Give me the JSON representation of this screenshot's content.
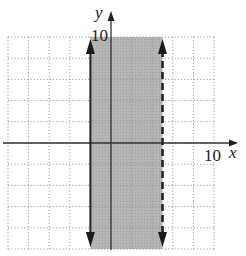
{
  "chart_data": {
    "type": "area",
    "title": "",
    "xlabel": "x",
    "ylabel": "y",
    "xlim": [
      -10,
      10
    ],
    "ylim": [
      -10,
      10
    ],
    "grid": true,
    "grid_step": 2,
    "tick_labels": {
      "x": "10",
      "y": "10"
    },
    "boundaries": [
      {
        "name": "left-boundary",
        "type": "vertical",
        "x": -2,
        "style": "solid",
        "included": true
      },
      {
        "name": "right-boundary",
        "type": "vertical",
        "x": 5,
        "style": "dashed",
        "included": false
      }
    ],
    "shaded_region": {
      "x_min": -2,
      "x_max": 5,
      "y_min": -10,
      "y_max": 10,
      "inequality": "-2 ≤ x < 5"
    },
    "colors": {
      "shade": "#b3b3b3",
      "line": "#222222",
      "grid": "#9a9a9a"
    }
  },
  "labels": {
    "x_axis": "x",
    "y_axis": "y",
    "x_tick": "10",
    "y_tick": "10"
  }
}
